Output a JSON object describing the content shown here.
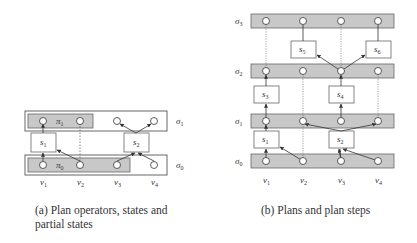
{
  "diagram_a": {
    "caption_line1": "(a) Plan operators, states and",
    "caption_line2": "partial states",
    "states": [
      {
        "id": "sigma1",
        "label": "σ",
        "sub": "1"
      },
      {
        "id": "sigma0",
        "label": "σ",
        "sub": "0"
      }
    ],
    "partial_states": [
      {
        "id": "pi1",
        "label": "π",
        "sub": "1"
      },
      {
        "id": "pi0",
        "label": "π",
        "sub": "0"
      }
    ],
    "operators": [
      {
        "id": "s1",
        "label": "s",
        "sub": "1"
      },
      {
        "id": "s2",
        "label": "s",
        "sub": "2"
      }
    ],
    "variables": [
      {
        "label": "v",
        "sub": "1"
      },
      {
        "label": "v",
        "sub": "2"
      },
      {
        "label": "v",
        "sub": "3"
      },
      {
        "label": "v",
        "sub": "4"
      }
    ]
  },
  "diagram_b": {
    "caption": "(b) Plans and plan steps",
    "states": [
      {
        "id": "sigma3",
        "label": "σ",
        "sub": "3"
      },
      {
        "id": "sigma2",
        "label": "σ",
        "sub": "2"
      },
      {
        "id": "sigma1",
        "label": "σ",
        "sub": "1"
      },
      {
        "id": "sigma0",
        "label": "σ",
        "sub": "0"
      }
    ],
    "steps": [
      {
        "id": "s5",
        "label": "s",
        "sub": "5"
      },
      {
        "id": "s6",
        "label": "s",
        "sub": "6"
      },
      {
        "id": "s3",
        "label": "s",
        "sub": "3"
      },
      {
        "id": "s4",
        "label": "s",
        "sub": "4"
      },
      {
        "id": "s1",
        "label": "s",
        "sub": "1"
      },
      {
        "id": "s2",
        "label": "s",
        "sub": "2"
      }
    ],
    "variables": [
      {
        "label": "v",
        "sub": "1"
      },
      {
        "label": "v",
        "sub": "2"
      },
      {
        "label": "v",
        "sub": "3"
      },
      {
        "label": "v",
        "sub": "4"
      }
    ]
  },
  "colors": {
    "band_fill": "#c8c8c8",
    "stroke": "#555555",
    "node_fill": "#ffffff"
  }
}
